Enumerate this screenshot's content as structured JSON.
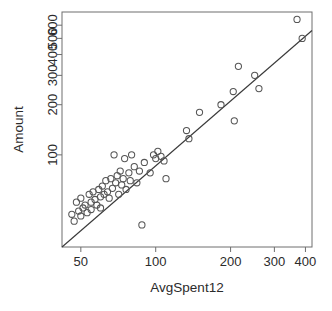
{
  "chart_data": {
    "type": "scatter",
    "title": "",
    "xlabel": "AvgSpent12",
    "ylabel": "Amount",
    "xscale": "log",
    "yscale": "log",
    "xlim": [
      42,
      425
    ],
    "ylim": [
      28,
      720
    ],
    "grid": false,
    "legend": null,
    "xticks": [
      50,
      100,
      200,
      300,
      400
    ],
    "xtick_labels": [
      "50",
      "100",
      "200",
      "300",
      "400"
    ],
    "yticks": [
      100,
      200,
      300,
      400,
      500,
      600
    ],
    "ytick_labels": [
      "100",
      "200",
      "300",
      "400",
      "500",
      "600"
    ],
    "marker": "open-circle",
    "marker_color": "#555555",
    "line_color": "#3a3a3a",
    "points": [
      {
        "x": 46,
        "y": 44
      },
      {
        "x": 47,
        "y": 40
      },
      {
        "x": 48,
        "y": 52
      },
      {
        "x": 49,
        "y": 46
      },
      {
        "x": 50,
        "y": 43
      },
      {
        "x": 50,
        "y": 55
      },
      {
        "x": 51,
        "y": 48
      },
      {
        "x": 52,
        "y": 50
      },
      {
        "x": 53,
        "y": 45
      },
      {
        "x": 54,
        "y": 58
      },
      {
        "x": 55,
        "y": 52
      },
      {
        "x": 55,
        "y": 47
      },
      {
        "x": 56,
        "y": 60
      },
      {
        "x": 57,
        "y": 54
      },
      {
        "x": 58,
        "y": 50
      },
      {
        "x": 59,
        "y": 62
      },
      {
        "x": 60,
        "y": 56
      },
      {
        "x": 60,
        "y": 48
      },
      {
        "x": 61,
        "y": 65
      },
      {
        "x": 62,
        "y": 58
      },
      {
        "x": 63,
        "y": 70
      },
      {
        "x": 64,
        "y": 60
      },
      {
        "x": 65,
        "y": 55
      },
      {
        "x": 66,
        "y": 72
      },
      {
        "x": 67,
        "y": 63
      },
      {
        "x": 68,
        "y": 100
      },
      {
        "x": 69,
        "y": 68
      },
      {
        "x": 70,
        "y": 75
      },
      {
        "x": 71,
        "y": 58
      },
      {
        "x": 72,
        "y": 80
      },
      {
        "x": 73,
        "y": 66
      },
      {
        "x": 74,
        "y": 72
      },
      {
        "x": 75,
        "y": 95
      },
      {
        "x": 76,
        "y": 62
      },
      {
        "x": 78,
        "y": 78
      },
      {
        "x": 79,
        "y": 70
      },
      {
        "x": 80,
        "y": 100
      },
      {
        "x": 82,
        "y": 85
      },
      {
        "x": 84,
        "y": 68
      },
      {
        "x": 86,
        "y": 80
      },
      {
        "x": 88,
        "y": 38
      },
      {
        "x": 90,
        "y": 90
      },
      {
        "x": 95,
        "y": 78
      },
      {
        "x": 98,
        "y": 100
      },
      {
        "x": 100,
        "y": 95
      },
      {
        "x": 102,
        "y": 105
      },
      {
        "x": 105,
        "y": 98
      },
      {
        "x": 108,
        "y": 92
      },
      {
        "x": 110,
        "y": 72
      },
      {
        "x": 133,
        "y": 140
      },
      {
        "x": 136,
        "y": 125
      },
      {
        "x": 150,
        "y": 180
      },
      {
        "x": 183,
        "y": 200
      },
      {
        "x": 205,
        "y": 240
      },
      {
        "x": 207,
        "y": 160
      },
      {
        "x": 215,
        "y": 340
      },
      {
        "x": 250,
        "y": 300
      },
      {
        "x": 260,
        "y": 250
      },
      {
        "x": 370,
        "y": 650
      },
      {
        "x": 388,
        "y": 500
      }
    ],
    "fit_line": {
      "type": "linear-on-log-axes",
      "start": {
        "x": 42,
        "y": 28
      },
      "end": {
        "x": 425,
        "y": 558
      }
    }
  }
}
